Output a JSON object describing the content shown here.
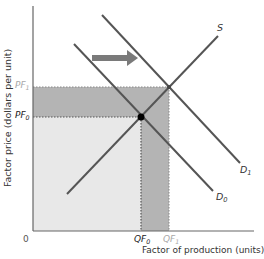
{
  "diagram": {
    "y_axis_label": "Factor price (dollars per unit)",
    "x_axis_label": "Factor of production (units)",
    "origin_label": "0",
    "price_labels": [
      {
        "base": "PF",
        "sub": "1",
        "color": "#a8a8a8"
      },
      {
        "base": "PF",
        "sub": "0",
        "color": "#222222"
      }
    ],
    "quantity_labels": [
      {
        "base": "QF",
        "sub": "0",
        "color": "#222222"
      },
      {
        "base": "QF",
        "sub": "1",
        "color": "#a8a8a8"
      }
    ],
    "curves": [
      {
        "name": "S",
        "label": "S",
        "type": "supply"
      },
      {
        "name": "D0",
        "base": "D",
        "sub": "0",
        "type": "demand"
      },
      {
        "name": "D1",
        "base": "D",
        "sub": "1",
        "type": "demand"
      }
    ],
    "shift_arrow": "demand increases (shift right)",
    "colors": {
      "axis": "#666666",
      "curve": "#555555",
      "light_area": "#e8e8e8",
      "dark_area": "#b4b4b4",
      "arrow": "#7a7a7a",
      "equilibrium_point": "#000000"
    }
  }
}
